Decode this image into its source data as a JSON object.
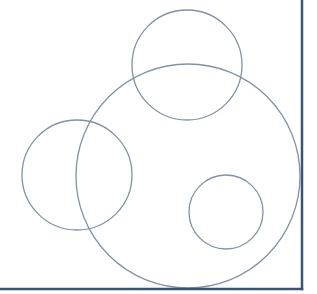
{
  "diagram": {
    "type": "circles",
    "width": 317,
    "height": 294,
    "background": "#ffffff",
    "frame": {
      "color": "#3e5372",
      "stroke_width": 2.5,
      "right_x": 302,
      "bottom_y": 289
    },
    "circle_style": {
      "stroke": "#8391a6",
      "stroke_width": 1.3,
      "fill": "none"
    },
    "circles": [
      {
        "id": "top-circle",
        "cx": 187,
        "cy": 65,
        "r": 55
      },
      {
        "id": "large-circle",
        "cx": 188,
        "cy": 176,
        "r": 112
      },
      {
        "id": "left-circle",
        "cx": 77,
        "cy": 175,
        "r": 55
      },
      {
        "id": "small-circle",
        "cx": 226,
        "cy": 212,
        "r": 37
      }
    ]
  }
}
